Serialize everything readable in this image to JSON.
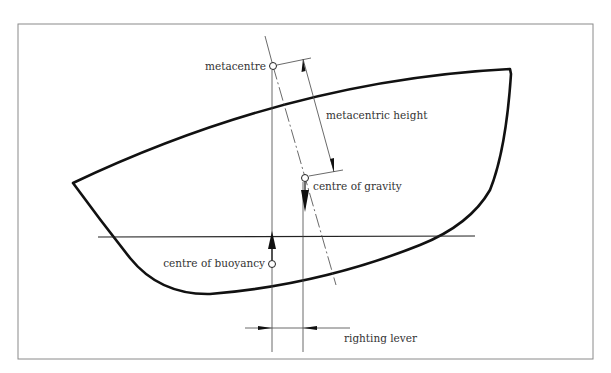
{
  "diagram": {
    "type": "ship-stability",
    "labels": {
      "metacentre": "metacentre",
      "metacentric_height": "metacentric height",
      "centre_of_gravity": "centre of gravity",
      "centre_of_buoyancy": "centre of buoyancy",
      "righting_lever": "righting lever"
    },
    "colors": {
      "frame": "#8a8a8a",
      "hull": "#111111",
      "lines": "#333333",
      "text": "#333333",
      "background": "#ffffff"
    }
  }
}
